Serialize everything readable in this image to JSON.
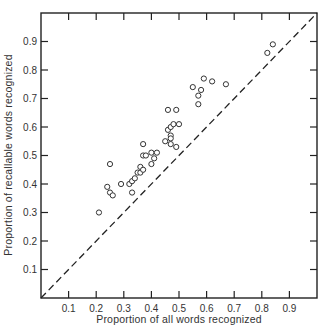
{
  "chart_data": {
    "type": "scatter",
    "title": "",
    "xlabel": "Proportion of all words recognized",
    "ylabel": "Proportion of recallable words recognized",
    "xlim": [
      0,
      1.0
    ],
    "ylim": [
      0,
      1.0
    ],
    "xticks": [
      "0.1",
      "0.2",
      "0.3",
      "0.4",
      "0.5",
      "0.6",
      "0.7",
      "0.8",
      "0.9"
    ],
    "yticks": [
      "0.1",
      "0.2",
      "0.3",
      "0.4",
      "0.5",
      "0.6",
      "0.7",
      "0.8",
      "0.9"
    ],
    "grid": false,
    "legend": null,
    "marker": "open-circle",
    "reference_line": {
      "style": "dashed",
      "from": [
        0,
        0
      ],
      "to": [
        1,
        1
      ],
      "label": "y = x"
    },
    "series": [
      {
        "name": "observations",
        "points": [
          {
            "x": 0.21,
            "y": 0.3
          },
          {
            "x": 0.25,
            "y": 0.47
          },
          {
            "x": 0.24,
            "y": 0.39
          },
          {
            "x": 0.25,
            "y": 0.37
          },
          {
            "x": 0.26,
            "y": 0.36
          },
          {
            "x": 0.29,
            "y": 0.4
          },
          {
            "x": 0.32,
            "y": 0.4
          },
          {
            "x": 0.33,
            "y": 0.41
          },
          {
            "x": 0.33,
            "y": 0.37
          },
          {
            "x": 0.34,
            "y": 0.42
          },
          {
            "x": 0.35,
            "y": 0.44
          },
          {
            "x": 0.36,
            "y": 0.44
          },
          {
            "x": 0.36,
            "y": 0.46
          },
          {
            "x": 0.37,
            "y": 0.45
          },
          {
            "x": 0.37,
            "y": 0.54
          },
          {
            "x": 0.37,
            "y": 0.5
          },
          {
            "x": 0.38,
            "y": 0.5
          },
          {
            "x": 0.4,
            "y": 0.51
          },
          {
            "x": 0.41,
            "y": 0.49
          },
          {
            "x": 0.4,
            "y": 0.47
          },
          {
            "x": 0.42,
            "y": 0.51
          },
          {
            "x": 0.45,
            "y": 0.55
          },
          {
            "x": 0.47,
            "y": 0.57
          },
          {
            "x": 0.47,
            "y": 0.56
          },
          {
            "x": 0.46,
            "y": 0.59
          },
          {
            "x": 0.47,
            "y": 0.6
          },
          {
            "x": 0.48,
            "y": 0.61
          },
          {
            "x": 0.5,
            "y": 0.61
          },
          {
            "x": 0.47,
            "y": 0.54
          },
          {
            "x": 0.49,
            "y": 0.53
          },
          {
            "x": 0.46,
            "y": 0.66
          },
          {
            "x": 0.49,
            "y": 0.66
          },
          {
            "x": 0.55,
            "y": 0.74
          },
          {
            "x": 0.57,
            "y": 0.71
          },
          {
            "x": 0.58,
            "y": 0.73
          },
          {
            "x": 0.57,
            "y": 0.68
          },
          {
            "x": 0.59,
            "y": 0.77
          },
          {
            "x": 0.62,
            "y": 0.76
          },
          {
            "x": 0.67,
            "y": 0.75
          },
          {
            "x": 0.82,
            "y": 0.86
          },
          {
            "x": 0.84,
            "y": 0.89
          }
        ]
      }
    ]
  }
}
